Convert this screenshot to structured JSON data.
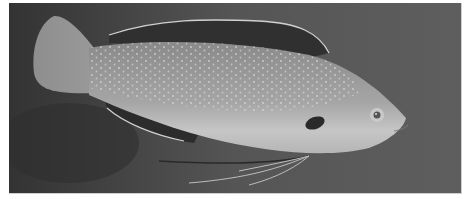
{
  "image": {
    "alt": "Grayscale photograph of a spotted wrasse fish swimming to the right against a dark background",
    "subject": "fish",
    "palette": {
      "background_dark": "#3a3a3a",
      "background_mid": "#5a5a5a",
      "body_light": "#a8a8a8",
      "belly_light": "#c4c4c4",
      "fin_dark": "#2e2e2e",
      "spot": "#d8d8d8",
      "frame_border": "#cfcfcf"
    }
  }
}
